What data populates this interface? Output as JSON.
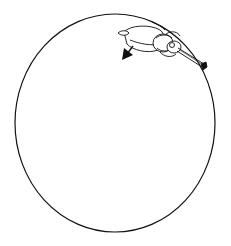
{
  "figure": {
    "colors": {
      "stroke": "#111111",
      "background": "#ffffff"
    },
    "circle": {
      "cx": 115,
      "cy": 123,
      "rx": 100,
      "ry": 109
    },
    "arrow": {
      "direction": "down-left"
    }
  }
}
